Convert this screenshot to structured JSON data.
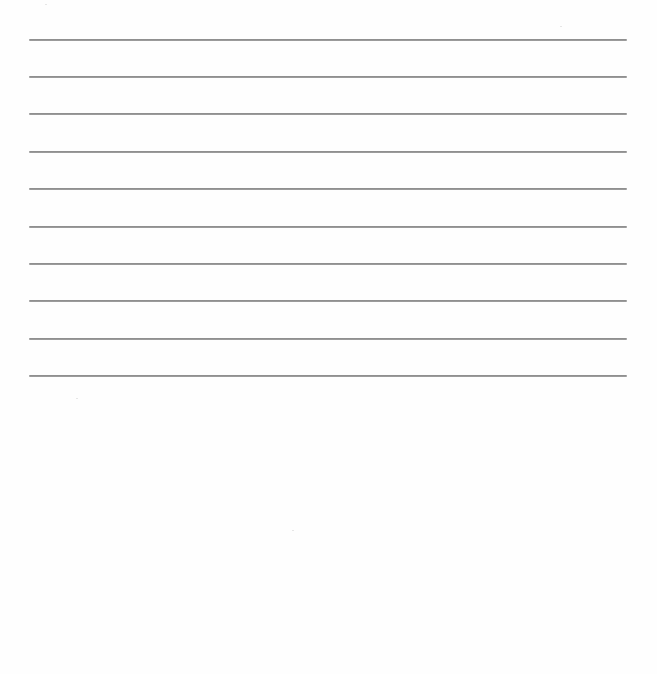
{
  "document": {
    "type": "blank-lined-page",
    "background_color": "#fefefe",
    "rule_color": "#919191",
    "rules": [
      {
        "index": 1,
        "y": 40
      },
      {
        "index": 2,
        "y": 77
      },
      {
        "index": 3,
        "y": 114
      },
      {
        "index": 4,
        "y": 152
      },
      {
        "index": 5,
        "y": 189
      },
      {
        "index": 6,
        "y": 227
      },
      {
        "index": 7,
        "y": 264
      },
      {
        "index": 8,
        "y": 301
      },
      {
        "index": 9,
        "y": 339
      },
      {
        "index": 10,
        "y": 376
      }
    ],
    "rule_left": 29,
    "rule_right": 627,
    "text_content": ""
  }
}
